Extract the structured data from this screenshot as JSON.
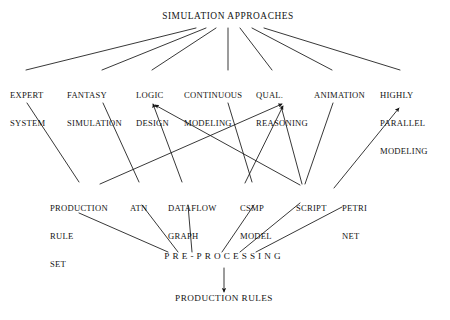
{
  "diagram": {
    "ink_color": "#141414",
    "background_color": "#ffffff",
    "root": {
      "id": "simulation-approaches",
      "label": "SIMULATION APPROACHES"
    },
    "approaches": [
      {
        "id": "expert-system",
        "line1": "EXPERT",
        "line2": "SYSTEM",
        "line3": ""
      },
      {
        "id": "fantasy-simulation",
        "line1": "FANTASY",
        "line2": "SIMULATION",
        "line3": ""
      },
      {
        "id": "logic-design",
        "line1": "LOGIC",
        "line2": "DESIGN",
        "line3": ""
      },
      {
        "id": "continuous-modeling",
        "line1": "CONTINUOUS",
        "line2": "MODELING",
        "line3": ""
      },
      {
        "id": "qual-reasoning",
        "line1": "QUAL.",
        "line2": "REASONING",
        "line3": ""
      },
      {
        "id": "animation",
        "line1": "ANIMATION",
        "line2": "",
        "line3": ""
      },
      {
        "id": "highly-parallel-modeling",
        "line1": "HIGHLY",
        "line2": "PARALLEL",
        "line3": "MODELING"
      }
    ],
    "techniques": [
      {
        "id": "production-rule-set",
        "line1": "PRODUCTION",
        "line2": "RULE",
        "line3": "SET"
      },
      {
        "id": "atn",
        "line1": "ATN",
        "line2": "",
        "line3": ""
      },
      {
        "id": "dataflow-graph",
        "line1": "DATAFLOW",
        "line2": "GRAPH",
        "line3": ""
      },
      {
        "id": "csmp-model",
        "line1": "CSMP",
        "line2": "MODEL",
        "line3": ""
      },
      {
        "id": "script",
        "line1": "SCRIPT",
        "line2": "",
        "line3": ""
      },
      {
        "id": "petri-net",
        "line1": "PETRI",
        "line2": "NET",
        "line3": ""
      }
    ],
    "stage": {
      "id": "pre-processing",
      "label": "PRE-PROCESSING"
    },
    "output": {
      "id": "production-rules",
      "label": "PRODUCTION RULES"
    }
  }
}
